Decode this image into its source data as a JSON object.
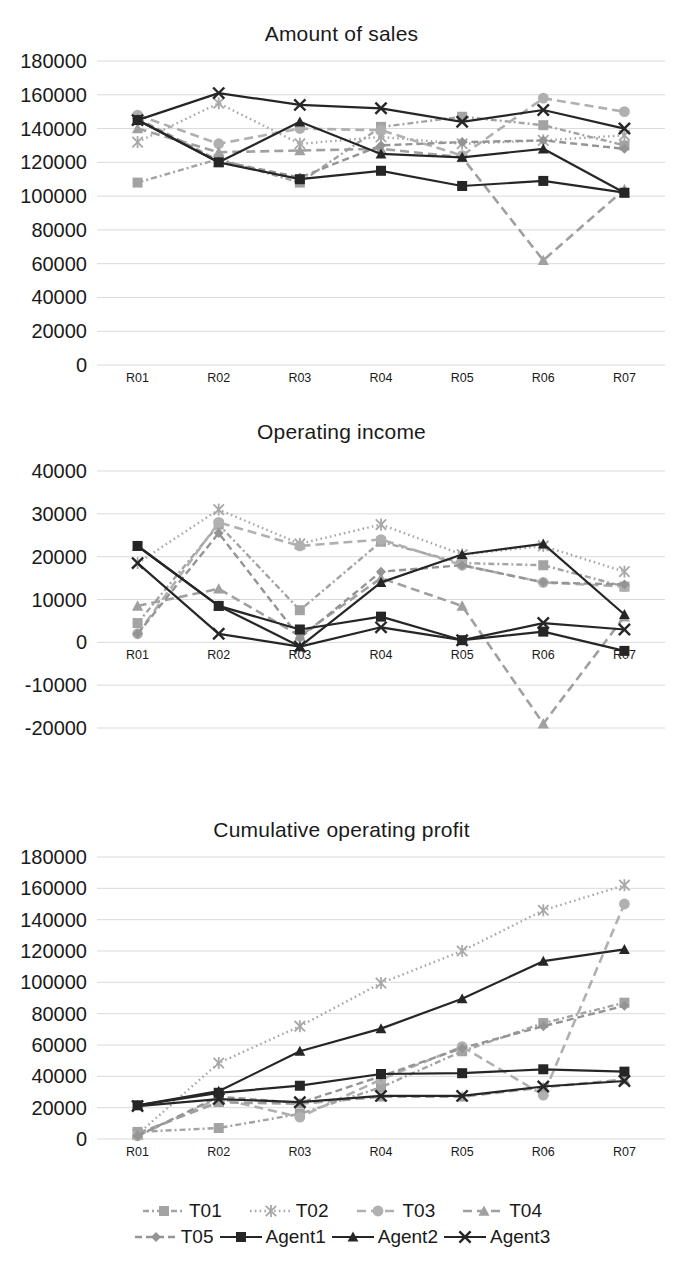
{
  "charts": [
    {
      "title": "Amount of sales",
      "ylabels": [
        "180000",
        "160000",
        "140000",
        "120000",
        "100000",
        "80000",
        "60000",
        "40000",
        "20000",
        "0"
      ],
      "xlabels": [
        "R01",
        "R02",
        "R03",
        "R04",
        "R05",
        "R06",
        "R07"
      ]
    },
    {
      "title": "Operating income",
      "ylabels": [
        "40000",
        "30000",
        "20000",
        "10000",
        "0",
        "-10000",
        "-20000"
      ],
      "xlabels": [
        "R01",
        "R02",
        "R03",
        "R04",
        "R05",
        "R06",
        "R07"
      ]
    },
    {
      "title": "Cumulative operating profit",
      "ylabels": [
        "180000",
        "160000",
        "140000",
        "120000",
        "100000",
        "80000",
        "60000",
        "40000",
        "20000",
        "0"
      ],
      "xlabels": [
        "R01",
        "R02",
        "R03",
        "R04",
        "R05",
        "R06",
        "R07"
      ]
    }
  ],
  "legend": {
    "row1": [
      {
        "label": "T01",
        "marker": "square",
        "dash": "dashdot",
        "color": "#a6a6a6"
      },
      {
        "label": "T02",
        "marker": "asterisk",
        "dash": "dotted",
        "color": "#a6a6a6"
      },
      {
        "label": "T03",
        "marker": "circle",
        "dash": "dashed",
        "color": "#b3b3b3"
      },
      {
        "label": "T04",
        "marker": "triangle",
        "dash": "dashed",
        "color": "#a6a6a6"
      }
    ],
    "row2": [
      {
        "label": "T05",
        "marker": "diamond",
        "dash": "dashed",
        "color": "#999999"
      },
      {
        "label": "Agent1",
        "marker": "square",
        "dash": "solid",
        "color": "#262626"
      },
      {
        "label": "Agent2",
        "marker": "triangle",
        "dash": "solid",
        "color": "#262626"
      },
      {
        "label": "Agent3",
        "marker": "cross",
        "dash": "solid",
        "color": "#262626"
      }
    ]
  },
  "chart_data": [
    {
      "type": "line",
      "title": "Amount of sales",
      "xlabel": "",
      "ylabel": "",
      "categories": [
        "R01",
        "R02",
        "R03",
        "R04",
        "R05",
        "R06",
        "R07"
      ],
      "ylim": [
        0,
        180000
      ],
      "ytick_step": 20000,
      "grid": true,
      "legend_position": "bottom",
      "series": [
        {
          "name": "T01",
          "values": [
            108000,
            122000,
            108000,
            141000,
            147000,
            142000,
            130000
          ]
        },
        {
          "name": "T02",
          "values": [
            132000,
            155000,
            131000,
            135000,
            131000,
            133000,
            136000
          ]
        },
        {
          "name": "T03",
          "values": [
            148000,
            131000,
            140000,
            139000,
            124000,
            158000,
            150000
          ]
        },
        {
          "name": "T04",
          "values": [
            140000,
            126000,
            127000,
            128000,
            123000,
            62000,
            104000
          ]
        },
        {
          "name": "T05",
          "values": [
            146000,
            121000,
            111000,
            130000,
            132000,
            133000,
            128000
          ]
        },
        {
          "name": "Agent1",
          "values": [
            145000,
            120000,
            110000,
            115000,
            106000,
            109000,
            102000
          ]
        },
        {
          "name": "Agent2",
          "values": [
            145000,
            120000,
            144000,
            125000,
            123000,
            128000,
            102000
          ]
        },
        {
          "name": "Agent3",
          "values": [
            145000,
            161000,
            154000,
            152000,
            144000,
            151000,
            140000
          ]
        }
      ]
    },
    {
      "type": "line",
      "title": "Operating income",
      "xlabel": "",
      "ylabel": "",
      "categories": [
        "R01",
        "R02",
        "R03",
        "R04",
        "R05",
        "R06",
        "R07"
      ],
      "ylim": [
        -20000,
        40000
      ],
      "ytick_step": 10000,
      "grid": true,
      "legend_position": "bottom",
      "series": [
        {
          "name": "T01",
          "values": [
            4500,
            27500,
            7500,
            23500,
            18500,
            18000,
            13000
          ]
        },
        {
          "name": "T02",
          "values": [
            18500,
            31000,
            23000,
            27500,
            20500,
            22500,
            16500
          ]
        },
        {
          "name": "T03",
          "values": [
            2000,
            28000,
            22500,
            24000,
            18000,
            14000,
            13000
          ]
        },
        {
          "name": "T04",
          "values": [
            8500,
            12500,
            1500,
            15000,
            8500,
            -19000,
            6000
          ]
        },
        {
          "name": "T05",
          "values": [
            2000,
            25500,
            1000,
            16500,
            18000,
            14000,
            13500
          ]
        },
        {
          "name": "Agent1",
          "values": [
            22500,
            8500,
            3000,
            6000,
            500,
            2500,
            -2000
          ]
        },
        {
          "name": "Agent2",
          "values": [
            22500,
            8500,
            -1000,
            14000,
            20500,
            23000,
            6500
          ]
        },
        {
          "name": "Agent3",
          "values": [
            18500,
            2000,
            -1000,
            3500,
            500,
            4500,
            3000
          ]
        }
      ]
    },
    {
      "type": "line",
      "title": "Cumulative operating profit",
      "xlabel": "",
      "ylabel": "",
      "categories": [
        "R01",
        "R02",
        "R03",
        "R04",
        "R05",
        "R06",
        "R07"
      ],
      "ylim": [
        0,
        180000
      ],
      "ytick_step": 20000,
      "grid": true,
      "legend_position": "bottom",
      "series": [
        {
          "name": "T01",
          "values": [
            4500,
            7000,
            16000,
            33000,
            56000,
            74000,
            87000
          ]
        },
        {
          "name": "T02",
          "values": [
            3000,
            48500,
            72000,
            99500,
            120000,
            146000,
            162000
          ]
        },
        {
          "name": "T03",
          "values": [
            2000,
            26000,
            14000,
            38000,
            59000,
            28000,
            150000
          ]
        },
        {
          "name": "T04",
          "values": [
            3500,
            23500,
            22500,
            27000,
            27000,
            33000,
            38000
          ]
        },
        {
          "name": "T05",
          "values": [
            2000,
            27000,
            23000,
            40000,
            58000,
            72000,
            85000
          ]
        },
        {
          "name": "Agent1",
          "values": [
            21500,
            29500,
            34000,
            41500,
            42000,
            44500,
            43000
          ]
        },
        {
          "name": "Agent2",
          "values": [
            21500,
            30500,
            56000,
            70500,
            89500,
            113500,
            121000
          ]
        },
        {
          "name": "Agent3",
          "values": [
            21000,
            25500,
            23500,
            27500,
            27500,
            33500,
            37000
          ]
        }
      ]
    }
  ]
}
